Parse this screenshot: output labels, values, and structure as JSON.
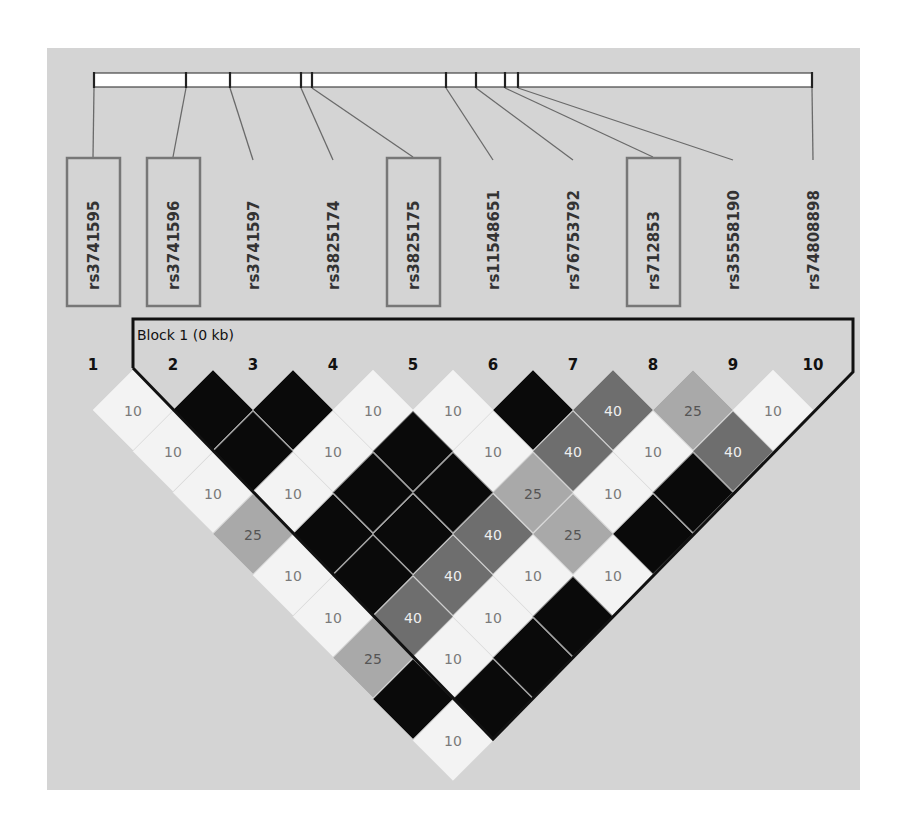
{
  "chart_data": {
    "type": "heatmap",
    "subtype": "linkage-disequilibrium-triangle",
    "title": "",
    "markers": [
      {
        "index": 1,
        "id": "rs3741595",
        "boxed": true,
        "bar_x": 94
      },
      {
        "index": 2,
        "id": "rs3741596",
        "boxed": true,
        "bar_x": 186
      },
      {
        "index": 3,
        "id": "rs3741597",
        "boxed": false,
        "bar_x": 230
      },
      {
        "index": 4,
        "id": "rs3825174",
        "boxed": false,
        "bar_x": 301
      },
      {
        "index": 5,
        "id": "rs3825175",
        "boxed": true,
        "bar_x": 312
      },
      {
        "index": 6,
        "id": "rs11548651",
        "boxed": false,
        "bar_x": 446
      },
      {
        "index": 7,
        "id": "rs76753792",
        "boxed": false,
        "bar_x": 476
      },
      {
        "index": 8,
        "id": "rs712853",
        "boxed": true,
        "bar_x": 505
      },
      {
        "index": 9,
        "id": "rs35558190",
        "boxed": false,
        "bar_x": 518
      },
      {
        "index": 10,
        "id": "rs74808898",
        "boxed": false,
        "bar_x": 812
      }
    ],
    "blocks": [
      {
        "label": "Block 1 (0 kb)",
        "start_marker": 2,
        "end_marker": 10
      }
    ],
    "legend": {
      "black": "strong LD (no value shown)",
      "values": [
        "10",
        "25",
        "40"
      ]
    },
    "cells": [
      {
        "i": 1,
        "j": 2,
        "value": "10",
        "shade": "light"
      },
      {
        "i": 2,
        "j": 3,
        "value": "",
        "shade": "black"
      },
      {
        "i": 3,
        "j": 4,
        "value": "",
        "shade": "black"
      },
      {
        "i": 4,
        "j": 5,
        "value": "10",
        "shade": "light"
      },
      {
        "i": 5,
        "j": 6,
        "value": "10",
        "shade": "light"
      },
      {
        "i": 6,
        "j": 7,
        "value": "",
        "shade": "black"
      },
      {
        "i": 7,
        "j": 8,
        "value": "40",
        "shade": "dark"
      },
      {
        "i": 8,
        "j": 9,
        "value": "25",
        "shade": "mid"
      },
      {
        "i": 9,
        "j": 10,
        "value": "10",
        "shade": "light"
      },
      {
        "i": 1,
        "j": 3,
        "value": "10",
        "shade": "light"
      },
      {
        "i": 2,
        "j": 4,
        "value": "",
        "shade": "black"
      },
      {
        "i": 3,
        "j": 5,
        "value": "10",
        "shade": "light"
      },
      {
        "i": 4,
        "j": 6,
        "value": "",
        "shade": "black"
      },
      {
        "i": 5,
        "j": 7,
        "value": "10",
        "shade": "light"
      },
      {
        "i": 6,
        "j": 8,
        "value": "40",
        "shade": "dark"
      },
      {
        "i": 7,
        "j": 9,
        "value": "10",
        "shade": "light"
      },
      {
        "i": 8,
        "j": 10,
        "value": "40",
        "shade": "dark"
      },
      {
        "i": 1,
        "j": 4,
        "value": "10",
        "shade": "light"
      },
      {
        "i": 2,
        "j": 5,
        "value": "10",
        "shade": "light"
      },
      {
        "i": 3,
        "j": 6,
        "value": "",
        "shade": "black"
      },
      {
        "i": 4,
        "j": 7,
        "value": "",
        "shade": "black"
      },
      {
        "i": 5,
        "j": 8,
        "value": "25",
        "shade": "mid"
      },
      {
        "i": 6,
        "j": 9,
        "value": "10",
        "shade": "light"
      },
      {
        "i": 7,
        "j": 10,
        "value": "",
        "shade": "black"
      },
      {
        "i": 1,
        "j": 5,
        "value": "25",
        "shade": "mid"
      },
      {
        "i": 2,
        "j": 6,
        "value": "",
        "shade": "black"
      },
      {
        "i": 3,
        "j": 7,
        "value": "",
        "shade": "black"
      },
      {
        "i": 4,
        "j": 8,
        "value": "40",
        "shade": "dark"
      },
      {
        "i": 5,
        "j": 9,
        "value": "25",
        "shade": "mid"
      },
      {
        "i": 6,
        "j": 10,
        "value": "",
        "shade": "black"
      },
      {
        "i": 1,
        "j": 6,
        "value": "10",
        "shade": "light"
      },
      {
        "i": 2,
        "j": 7,
        "value": "",
        "shade": "black"
      },
      {
        "i": 3,
        "j": 8,
        "value": "40",
        "shade": "dark"
      },
      {
        "i": 4,
        "j": 9,
        "value": "10",
        "shade": "light"
      },
      {
        "i": 5,
        "j": 10,
        "value": "10",
        "shade": "light"
      },
      {
        "i": 1,
        "j": 7,
        "value": "10",
        "shade": "light"
      },
      {
        "i": 2,
        "j": 8,
        "value": "40",
        "shade": "dark"
      },
      {
        "i": 3,
        "j": 9,
        "value": "10",
        "shade": "light"
      },
      {
        "i": 4,
        "j": 10,
        "value": "",
        "shade": "black"
      },
      {
        "i": 1,
        "j": 8,
        "value": "25",
        "shade": "mid"
      },
      {
        "i": 2,
        "j": 9,
        "value": "10",
        "shade": "light"
      },
      {
        "i": 3,
        "j": 10,
        "value": "",
        "shade": "black"
      },
      {
        "i": 1,
        "j": 9,
        "value": "",
        "shade": "black"
      },
      {
        "i": 2,
        "j": 10,
        "value": "",
        "shade": "black"
      },
      {
        "i": 1,
        "j": 10,
        "value": "10",
        "shade": "light"
      }
    ]
  },
  "colors": {
    "background_panel": "#d4d4d4",
    "black": "#0a0a0a",
    "dark": "#6e6e6e",
    "mid": "#a9a9a9",
    "light": "#f3f3f3",
    "text_on_dark": "#eeeeee",
    "text_on_mid": "#555555",
    "text_on_light": "#7a7a7a",
    "label_box": "#777777",
    "connector": "#6a6a6a",
    "block_outline": "#111111"
  },
  "block_title": "Block 1 (0 kb)"
}
